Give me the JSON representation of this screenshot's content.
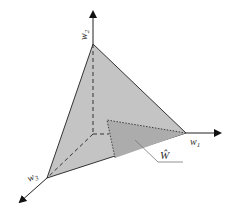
{
  "diagram": {
    "type": "3d-simplex",
    "colors": {
      "background": "#ffffff",
      "simplex_fill": "#c4c4c4",
      "subregion_fill": "#acacac",
      "axis": "#222222",
      "edge": "#333333"
    },
    "axes": [
      {
        "id": "w1",
        "label": "w",
        "subscript": "1",
        "direction": "right"
      },
      {
        "id": "w2",
        "label": "w",
        "subscript": "2",
        "direction": "up"
      },
      {
        "id": "w3",
        "label": "w",
        "subscript": "3",
        "direction": "down-left"
      }
    ],
    "regions": [
      {
        "id": "simplex",
        "description": "weight simplex triangle"
      },
      {
        "id": "w-hat",
        "label": "Ŵ",
        "description": "shaded subregion of simplex"
      }
    ]
  }
}
